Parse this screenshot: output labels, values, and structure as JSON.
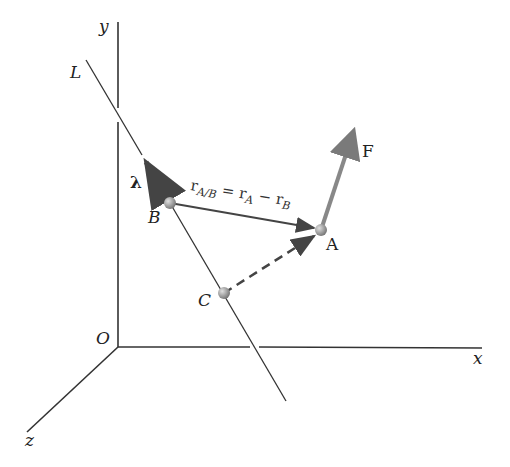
{
  "diagram": {
    "axes": {
      "x": "x",
      "y": "y",
      "z": "z",
      "origin": "O"
    },
    "line_label": "L",
    "points": {
      "A": "A",
      "B": "B",
      "C": "C"
    },
    "unit_vector": "λ",
    "force": "F",
    "equation": {
      "r": "r",
      "sub_ab": "A/B",
      "equals": " = r",
      "sub_a": "A",
      "minus": " − r",
      "sub_b": "B"
    },
    "colors": {
      "line": "#333333",
      "force": "#777777",
      "point": "#999999"
    }
  }
}
